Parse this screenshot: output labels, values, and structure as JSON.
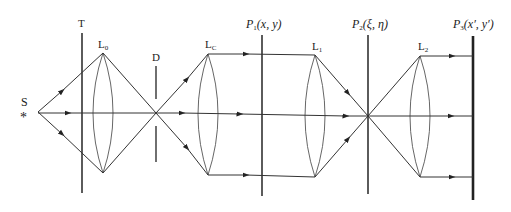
{
  "diagram": {
    "type": "optical 4f double-diffraction system",
    "labels": {
      "source": "S",
      "stop": "T",
      "lens0": {
        "main": "L",
        "sub": "0"
      },
      "aperture": "D",
      "lensC": {
        "main": "L",
        "sub": "C"
      },
      "lens1": {
        "main": "L",
        "sub": "1"
      },
      "lens2": {
        "main": "L",
        "sub": "2"
      },
      "plane1": {
        "main": "P",
        "sub": "1",
        "coords": "(x, y)"
      },
      "plane2": {
        "main": "P",
        "sub": "2",
        "coords": "(ξ, η)"
      },
      "plane3": {
        "main": "P",
        "sub": "3",
        "coords": "(x′, y′)"
      }
    },
    "source_symbol": "*",
    "colors": {
      "line": "#333333",
      "lens": "#555555",
      "text": "#222222",
      "background": "#ffffff"
    }
  }
}
